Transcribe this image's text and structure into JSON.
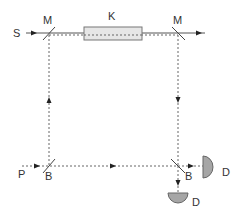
{
  "diagram": {
    "type": "Mach-Zehnder interferometer schematic",
    "labels": {
      "source": "S",
      "mirror_left": "M",
      "mirror_right": "M",
      "component": "K",
      "input_port": "P",
      "beamsplitter_left": "B",
      "beamsplitter_right": "B",
      "detector_right": "D",
      "detector_bottom": "D"
    },
    "colors": {
      "beam": "#555555",
      "component_fill": "#e6e6e6",
      "detector_fill": "#a6a6a6",
      "text": "#333333"
    }
  }
}
